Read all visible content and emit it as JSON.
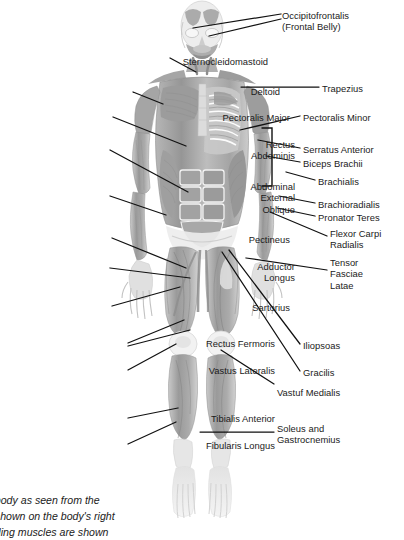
{
  "figure": {
    "view": "anterior",
    "palette": {
      "muscle_dark": "#8e8e8e",
      "muscle_mid": "#a8a8a8",
      "muscle_light": "#c4c4c4",
      "muscle_pale": "#dcdcdc",
      "tendon": "#f0f0f0",
      "bone": "#e8e8e8",
      "outline": "#9a9a9a",
      "leader": "#111111",
      "text": "#1b1b1b",
      "background": "#ffffff"
    }
  },
  "labels_right": [
    {
      "id": "occipitofrontalis",
      "text": "Occipitofrontalis\n(Frontal Belly)",
      "x": 282,
      "y": 10
    },
    {
      "id": "trapezius",
      "text": "Trapezius",
      "x": 322,
      "y": 83
    },
    {
      "id": "pectoralis-minor",
      "text": "Pectoralis Minor",
      "x": 303,
      "y": 112
    },
    {
      "id": "serratus-anterior",
      "text": "Serratus Anterior",
      "x": 303,
      "y": 144
    },
    {
      "id": "biceps-brachii",
      "text": "Biceps Brachii",
      "x": 303,
      "y": 158
    },
    {
      "id": "brachialis",
      "text": "Brachialis",
      "x": 318,
      "y": 176
    },
    {
      "id": "brachioradialis",
      "text": "Brachioradialis",
      "x": 318,
      "y": 199
    },
    {
      "id": "pronator-teres",
      "text": "Pronator Teres",
      "x": 318,
      "y": 212
    },
    {
      "id": "flexor-carpi-radialis",
      "text": "Flexor Carpi\nRadialis",
      "x": 330,
      "y": 228
    },
    {
      "id": "tensor-fasciae-latae",
      "text": "Tensor\nFasciae\nLatae",
      "x": 330,
      "y": 257
    },
    {
      "id": "iliopsoas",
      "text": "Iliopsoas",
      "x": 303,
      "y": 340
    },
    {
      "id": "gracilis",
      "text": "Gracilis",
      "x": 303,
      "y": 367
    },
    {
      "id": "vastus-medialis",
      "text": "Vastuf Medialis",
      "x": 277,
      "y": 387
    },
    {
      "id": "soleus-gastrocnemius",
      "text": "Soleus and\nGastrocnemius",
      "x": 277,
      "y": 423
    }
  ],
  "labels_left": [
    {
      "id": "sternocleidomastoid",
      "text": "Sternocleidomastoid",
      "right": 268,
      "y": 56
    },
    {
      "id": "deltoid",
      "text": "Deltoid",
      "right": 280,
      "y": 86
    },
    {
      "id": "pectoralis-major",
      "text": "Pectoralis Major",
      "right": 290,
      "y": 112
    },
    {
      "id": "rectus-abdominis",
      "text": "Rectus\nAbdominis",
      "right": 295,
      "y": 139
    },
    {
      "id": "abdominal-external-oblique",
      "text": "Abdominal\nExternal\nOblique",
      "right": 295,
      "y": 181
    },
    {
      "id": "pectineus",
      "text": "Pectineus",
      "right": 290,
      "y": 234
    },
    {
      "id": "adductor-longus",
      "text": "Adductor\nLongus",
      "right": 295,
      "y": 261
    },
    {
      "id": "sartorius",
      "text": "Sartorius",
      "right": 290,
      "y": 302
    },
    {
      "id": "rectus-femoris",
      "text": "Rectus Fermoris",
      "right": 275,
      "y": 338
    },
    {
      "id": "vastus-lateralis",
      "text": "Vastus Lateralis",
      "right": 275,
      "y": 365
    },
    {
      "id": "tibialis-anterior",
      "text": "Tibialis Anterior",
      "right": 275,
      "y": 413
    },
    {
      "id": "fibularis-longus",
      "text": "Fibularis Longus",
      "right": 275,
      "y": 440
    }
  ],
  "caption": {
    "text": "...body as seen from the\n...shown on the body's right\n...ding muscles are shown",
    "note": "clipped at left and bottom edges"
  }
}
